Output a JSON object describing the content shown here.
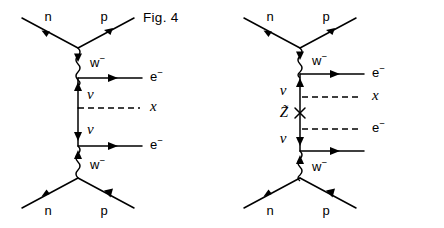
{
  "page": {
    "background_color": "#ffffff",
    "line_color": "#000000",
    "width": 444,
    "height": 228
  },
  "figures": [
    {
      "id": "fig4",
      "caption": "Fig. 4",
      "description": "Neutrinoless double beta decay via light neutrino exchange with an x insertion",
      "vertices": {
        "top": {
          "x": 78,
          "y": 48
        },
        "bottom": {
          "x": 78,
          "y": 178
        }
      },
      "external_legs": [
        {
          "name": "n-in-top",
          "label": "n",
          "label_x": 48,
          "label_y": 18,
          "type": "fermion"
        },
        {
          "name": "p-out-top",
          "label": "p",
          "label_x": 104,
          "label_y": 18,
          "type": "fermion"
        },
        {
          "name": "n-in-bottom",
          "label": "n",
          "label_x": 48,
          "label_y": 212,
          "type": "fermion"
        },
        {
          "name": "p-out-bottom",
          "label": "p",
          "label_x": 104,
          "label_y": 212,
          "type": "fermion"
        }
      ],
      "internal_lines": [
        {
          "name": "w-boson-upper",
          "label": "w",
          "superscript": "−",
          "type": "wavy-boson",
          "label_x": 93,
          "label_y": 64
        },
        {
          "name": "neutrino-upper",
          "label": "ν",
          "type": "fermion",
          "label_x": 88,
          "label_y": 96,
          "side": "right"
        },
        {
          "name": "neutrino-lower",
          "label": "ν",
          "type": "fermion",
          "label_x": 88,
          "label_y": 131,
          "side": "right"
        },
        {
          "name": "w-boson-lower",
          "label": "w",
          "superscript": "−",
          "type": "wavy-boson",
          "label_x": 93,
          "label_y": 166
        }
      ],
      "outgoing_lines": [
        {
          "name": "electron-upper",
          "label": "e",
          "superscript": "−",
          "type": "solid-arrow",
          "y": 78,
          "label_x": 152,
          "label_y": 78
        },
        {
          "name": "x-insertion",
          "label": "x",
          "superscript": "",
          "type": "dashed",
          "y": 108,
          "label_x": 152,
          "label_y": 108
        },
        {
          "name": "electron-lower",
          "label": "e",
          "superscript": "−",
          "type": "solid-arrow",
          "y": 146,
          "label_x": 152,
          "label_y": 146
        }
      ]
    },
    {
      "id": "fig5",
      "caption": "Fig. 5",
      "description": "Neutrinoless double beta decay via zino exchange with x and electron insertions",
      "vertices": {
        "top": {
          "x": 78,
          "y": 48
        },
        "bottom": {
          "x": 78,
          "y": 178
        }
      },
      "external_legs": [
        {
          "name": "n-in-top",
          "label": "n",
          "label_x": 48,
          "label_y": 18,
          "type": "fermion"
        },
        {
          "name": "p-out-top",
          "label": "p",
          "label_x": 104,
          "label_y": 18,
          "type": "fermion"
        },
        {
          "name": "n-in-bottom",
          "label": "n",
          "label_x": 48,
          "label_y": 212,
          "type": "fermion"
        },
        {
          "name": "p-out-bottom",
          "label": "p",
          "label_x": 104,
          "label_y": 212,
          "type": "fermion"
        }
      ],
      "internal_lines": [
        {
          "name": "w-boson-upper",
          "label": "w",
          "superscript": "−",
          "type": "wavy-boson",
          "label_x": 93,
          "label_y": 64
        },
        {
          "name": "neutrino-upper",
          "label": "ν",
          "type": "fermion",
          "label_x": 60,
          "label_y": 92,
          "side": "left"
        },
        {
          "name": "zino-propagator",
          "label": "Z̃",
          "type": "fermion-cross",
          "label_x": 57,
          "label_y": 117,
          "side": "left",
          "cross_mark": "×"
        },
        {
          "name": "neutrino-lower",
          "label": "ν",
          "type": "fermion",
          "label_x": 60,
          "label_y": 140,
          "side": "left"
        },
        {
          "name": "w-boson-lower",
          "label": "w",
          "superscript": "−",
          "type": "wavy-boson",
          "label_x": 93,
          "label_y": 166
        }
      ],
      "outgoing_lines": [
        {
          "name": "electron-upper",
          "label": "e",
          "superscript": "−",
          "type": "solid-arrow",
          "y": 74,
          "label_x": 152,
          "label_y": 74
        },
        {
          "name": "x-insertion",
          "label": "x",
          "superscript": "",
          "type": "dashed",
          "y": 97,
          "label_x": 152,
          "label_y": 97
        },
        {
          "name": "electron-dashed",
          "label": "e",
          "superscript": "−",
          "type": "dashed",
          "y": 129,
          "label_x": 152,
          "label_y": 129
        },
        {
          "name": "electron-plain",
          "label": "",
          "superscript": "",
          "type": "solid-arrow",
          "y": 151,
          "label_x": 152,
          "label_y": 151
        }
      ]
    }
  ]
}
